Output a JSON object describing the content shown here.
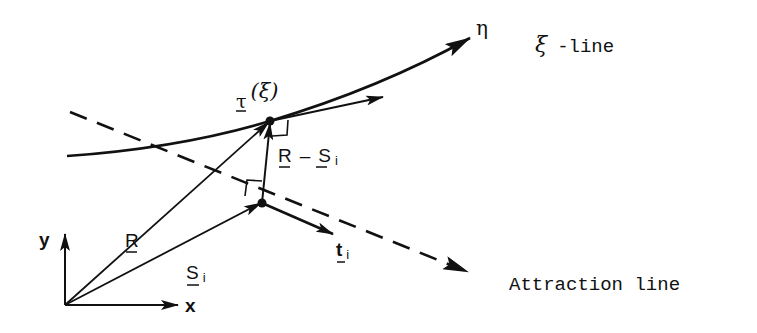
{
  "figure": {
    "labels": {
      "eta": "η",
      "xi_line_symbol": "ξ",
      "xi_line_text": "-line",
      "tau": "τ",
      "tau_arg": "(ξ)",
      "r_minus_s_R": "R",
      "r_minus_s_dash": "–",
      "r_minus_s_S": "S",
      "r_minus_s_sub": "i",
      "R": "R",
      "S": "S",
      "S_sub": "i",
      "t": "t",
      "t_sub": "i",
      "y_axis": "y",
      "x_axis": "x",
      "attraction_line": "Attraction line"
    },
    "colors": {
      "ink": "#111111",
      "background": "#ffffff"
    }
  }
}
